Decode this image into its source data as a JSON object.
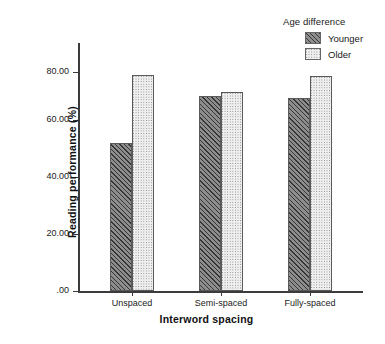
{
  "legend": {
    "title": "Age difference",
    "entries": [
      {
        "label": "Younger",
        "swatch": "younger-swatch",
        "color": "#8d8d8d"
      },
      {
        "label": "Older",
        "swatch": "older-swatch",
        "color": "#efefef"
      }
    ]
  },
  "axes": {
    "y_title": "Reading performance (%)",
    "x_title": "Interword spacing",
    "y_ticks": [
      ".00",
      "20.00",
      "40.00",
      "60.00",
      "80.00"
    ],
    "x_ticks": [
      "Unspaced",
      "Semi-spaced",
      "Fully-spaced"
    ]
  },
  "chart_data": {
    "type": "bar",
    "title": "",
    "subtitle": "",
    "xlabel": "Interword spacing",
    "ylabel": "Reading performance (%)",
    "categories": [
      "Unspaced",
      "Semi-spaced",
      "Fully-spaced"
    ],
    "series": [
      {
        "name": "Younger",
        "values": [
          52.4,
          68.8,
          68.0
        ],
        "color": "#8d8d8d",
        "pattern": "diagonal-hatch"
      },
      {
        "name": "Older",
        "values": [
          76.2,
          70.2,
          75.8
        ],
        "color": "#efefef",
        "pattern": "dotted"
      }
    ],
    "ylim": [
      0,
      87
    ],
    "ytick_values": [
      0,
      20,
      40,
      60,
      80
    ],
    "ytick_labels": [
      ".00",
      "20.00",
      "40.00",
      "60.00",
      "80.00"
    ],
    "grid": false,
    "legend_position": "top-right",
    "legend_title": "Age difference"
  }
}
